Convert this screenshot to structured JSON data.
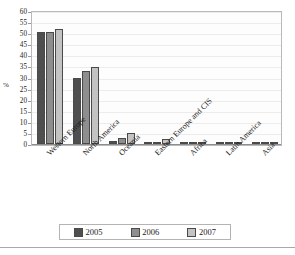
{
  "chart_data": {
    "type": "bar",
    "title": "",
    "xlabel": "",
    "ylabel": "%",
    "ylim": [
      0,
      60
    ],
    "yticks": [
      0,
      5,
      10,
      15,
      20,
      25,
      30,
      35,
      40,
      45,
      50,
      55,
      60
    ],
    "grid": true,
    "legend_position": "bottom",
    "categories": [
      "Western Europe",
      "North America",
      "Oceania",
      "Eastern Europe and CIS",
      "Africa",
      "Latin America",
      "Asia"
    ],
    "series": [
      {
        "name": "2005",
        "color": "#4f4f4f",
        "values": [
          50.4,
          29.6,
          1.5,
          0.7,
          0.8,
          0.2,
          0.2
        ]
      },
      {
        "name": "2006",
        "color": "#8e8e8e",
        "values": [
          50.6,
          33.0,
          2.9,
          1.1,
          0.3,
          1.0,
          0.2
        ]
      },
      {
        "name": "2007",
        "color": "#c3c3c3",
        "values": [
          51.8,
          34.8,
          4.8,
          2.1,
          0.3,
          1.0,
          0.2
        ]
      }
    ]
  },
  "axis": {
    "y_title": "%"
  },
  "legend": {
    "entries": [
      "2005",
      "2006",
      "2007"
    ]
  }
}
